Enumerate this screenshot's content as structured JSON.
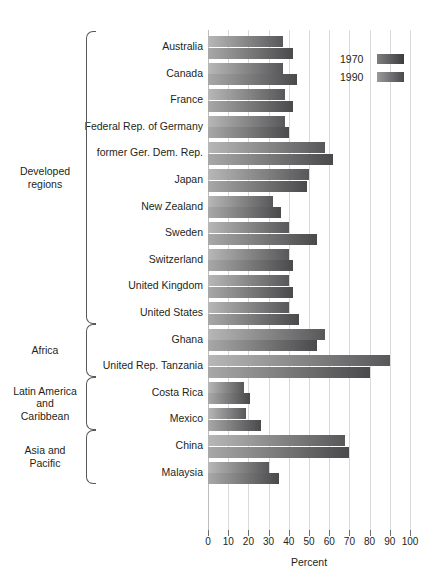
{
  "chart_data": {
    "type": "bar",
    "orientation": "horizontal",
    "title": "",
    "xlabel": "Percent",
    "ylabel": "",
    "xlim": [
      0,
      100
    ],
    "xticks": [
      0,
      10,
      20,
      30,
      40,
      50,
      60,
      70,
      80,
      90,
      100
    ],
    "grid": true,
    "legend_position": "top-right",
    "legend": [
      "1970",
      "1990"
    ],
    "categories": [
      "Australia",
      "Canada",
      "France",
      "Federal Rep. of Germany",
      "former Ger. Dem. Rep.",
      "Japan",
      "New Zealand",
      "Sweden",
      "Switzerland",
      "United Kingdom",
      "United States",
      "Ghana",
      "United Rep. Tanzania",
      "Costa Rica",
      "Mexico",
      "China",
      "Malaysia"
    ],
    "series": [
      {
        "name": "1970",
        "color": "#58585a",
        "values": [
          37,
          37,
          38,
          38,
          58,
          50,
          32,
          40,
          40,
          40,
          40,
          58,
          90,
          18,
          19,
          68,
          30
        ]
      },
      {
        "name": "1990",
        "color": "#4a4a4c",
        "values": [
          42,
          44,
          42,
          40,
          62,
          49,
          36,
          54,
          42,
          42,
          45,
          54,
          80,
          21,
          26,
          70,
          35
        ]
      }
    ],
    "groups": [
      {
        "label": "Developed\nregions",
        "label_lines": [
          "Developed",
          "regions"
        ],
        "start": 0,
        "end": 10
      },
      {
        "label": "Africa",
        "label_lines": [
          "Africa"
        ],
        "start": 11,
        "end": 12
      },
      {
        "label": "Latin America and Caribbean",
        "label_lines": [
          "Latin America",
          "and",
          "Caribbean"
        ],
        "start": 13,
        "end": 14
      },
      {
        "label": "Asia and Pacific",
        "label_lines": [
          "Asia and",
          "Pacific"
        ],
        "start": 15,
        "end": 16
      }
    ]
  },
  "axis": {
    "title": "Percent",
    "ticks": [
      "0",
      "10",
      "20",
      "30",
      "40",
      "50",
      "60",
      "70",
      "80",
      "90",
      "100"
    ]
  },
  "legend": {
    "items": [
      {
        "label": "1970"
      },
      {
        "label": "1990"
      }
    ]
  },
  "groups": [
    {
      "lines": [
        "Developed",
        "regions"
      ]
    },
    {
      "lines": [
        "Africa"
      ]
    },
    {
      "lines": [
        "Latin America",
        "and",
        "Caribbean"
      ]
    },
    {
      "lines": [
        "Asia and",
        "Pacific"
      ]
    }
  ]
}
